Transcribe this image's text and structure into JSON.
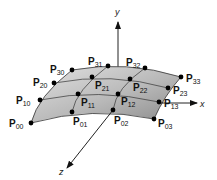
{
  "figure": {
    "colors": {
      "surface_light": "#d9d9d9",
      "surface_dark": "#8f8f8f",
      "grid_line": "#333333",
      "point": "#000000",
      "axis": "#222222"
    }
  },
  "axes": [
    {
      "name": "y",
      "label": "y",
      "from": [
        118,
        68
      ],
      "to": [
        118,
        22
      ],
      "label_pos": [
        115,
        15
      ]
    },
    {
      "name": "x",
      "label": "x",
      "from": [
        158,
        103
      ],
      "to": [
        197,
        103
      ],
      "label_pos": [
        200,
        107
      ]
    },
    {
      "name": "z",
      "label": "z",
      "from": [
        113,
        110
      ],
      "to": [
        67,
        168
      ],
      "label_pos": [
        59,
        175
      ]
    }
  ],
  "control_points": [
    {
      "id": "P00",
      "letter": "P",
      "sub": "00",
      "x": 31,
      "y": 123,
      "lx": 9,
      "ly": 127
    },
    {
      "id": "P01",
      "letter": "P",
      "sub": "01",
      "x": 72,
      "y": 112,
      "lx": 73,
      "ly": 125
    },
    {
      "id": "P02",
      "letter": "P",
      "sub": "02",
      "x": 113,
      "y": 110,
      "lx": 114,
      "ly": 124
    },
    {
      "id": "P03",
      "letter": "P",
      "sub": "03",
      "x": 154,
      "y": 119,
      "lx": 158,
      "ly": 127
    },
    {
      "id": "P10",
      "letter": "P",
      "sub": "10",
      "x": 40,
      "y": 100,
      "lx": 16,
      "ly": 104
    },
    {
      "id": "P11",
      "letter": "P",
      "sub": "11",
      "x": 78,
      "y": 94,
      "lx": 81,
      "ly": 106
    },
    {
      "id": "P12",
      "letter": "P",
      "sub": "12",
      "x": 118,
      "y": 94,
      "lx": 121,
      "ly": 105
    },
    {
      "id": "P13",
      "letter": "P",
      "sub": "13",
      "x": 159,
      "y": 102,
      "lx": 164,
      "ly": 107
    },
    {
      "id": "P20",
      "letter": "P",
      "sub": "20",
      "x": 54,
      "y": 83,
      "lx": 33,
      "ly": 86
    },
    {
      "id": "P21",
      "letter": "P",
      "sub": "21",
      "x": 92,
      "y": 77,
      "lx": 95,
      "ly": 89
    },
    {
      "id": "P22",
      "letter": "P",
      "sub": "22",
      "x": 130,
      "y": 79,
      "lx": 133,
      "ly": 91
    },
    {
      "id": "P23",
      "letter": "P",
      "sub": "23",
      "x": 168,
      "y": 88,
      "lx": 173,
      "ly": 94
    },
    {
      "id": "P30",
      "letter": "P",
      "sub": "30",
      "x": 72,
      "y": 70,
      "lx": 50,
      "ly": 73
    },
    {
      "id": "P31",
      "letter": "P",
      "sub": "31",
      "x": 108,
      "y": 66,
      "lx": 88,
      "ly": 65
    },
    {
      "id": "P32",
      "letter": "P",
      "sub": "32",
      "x": 145,
      "y": 68,
      "lx": 126,
      "ly": 66
    },
    {
      "id": "P33",
      "letter": "P",
      "sub": "33",
      "x": 181,
      "y": 77,
      "lx": 186,
      "ly": 82
    }
  ],
  "labels": {
    "P00": {
      "p": "P",
      "s": "00"
    },
    "P01": {
      "p": "P",
      "s": "01"
    },
    "P02": {
      "p": "P",
      "s": "02"
    },
    "P03": {
      "p": "P",
      "s": "03"
    },
    "P10": {
      "p": "P",
      "s": "10"
    },
    "P11": {
      "p": "P",
      "s": "11"
    },
    "P12": {
      "p": "P",
      "s": "12"
    },
    "P13": {
      "p": "P",
      "s": "13"
    },
    "P20": {
      "p": "P",
      "s": "20"
    },
    "P21": {
      "p": "P",
      "s": "21"
    },
    "P22": {
      "p": "P",
      "s": "22"
    },
    "P23": {
      "p": "P",
      "s": "23"
    },
    "P30": {
      "p": "P",
      "s": "30"
    },
    "P31": {
      "p": "P",
      "s": "31"
    },
    "P32": {
      "p": "P",
      "s": "32"
    },
    "P33": {
      "p": "P",
      "s": "33"
    },
    "axis_x": "x",
    "axis_y": "y",
    "axis_z": "z"
  }
}
